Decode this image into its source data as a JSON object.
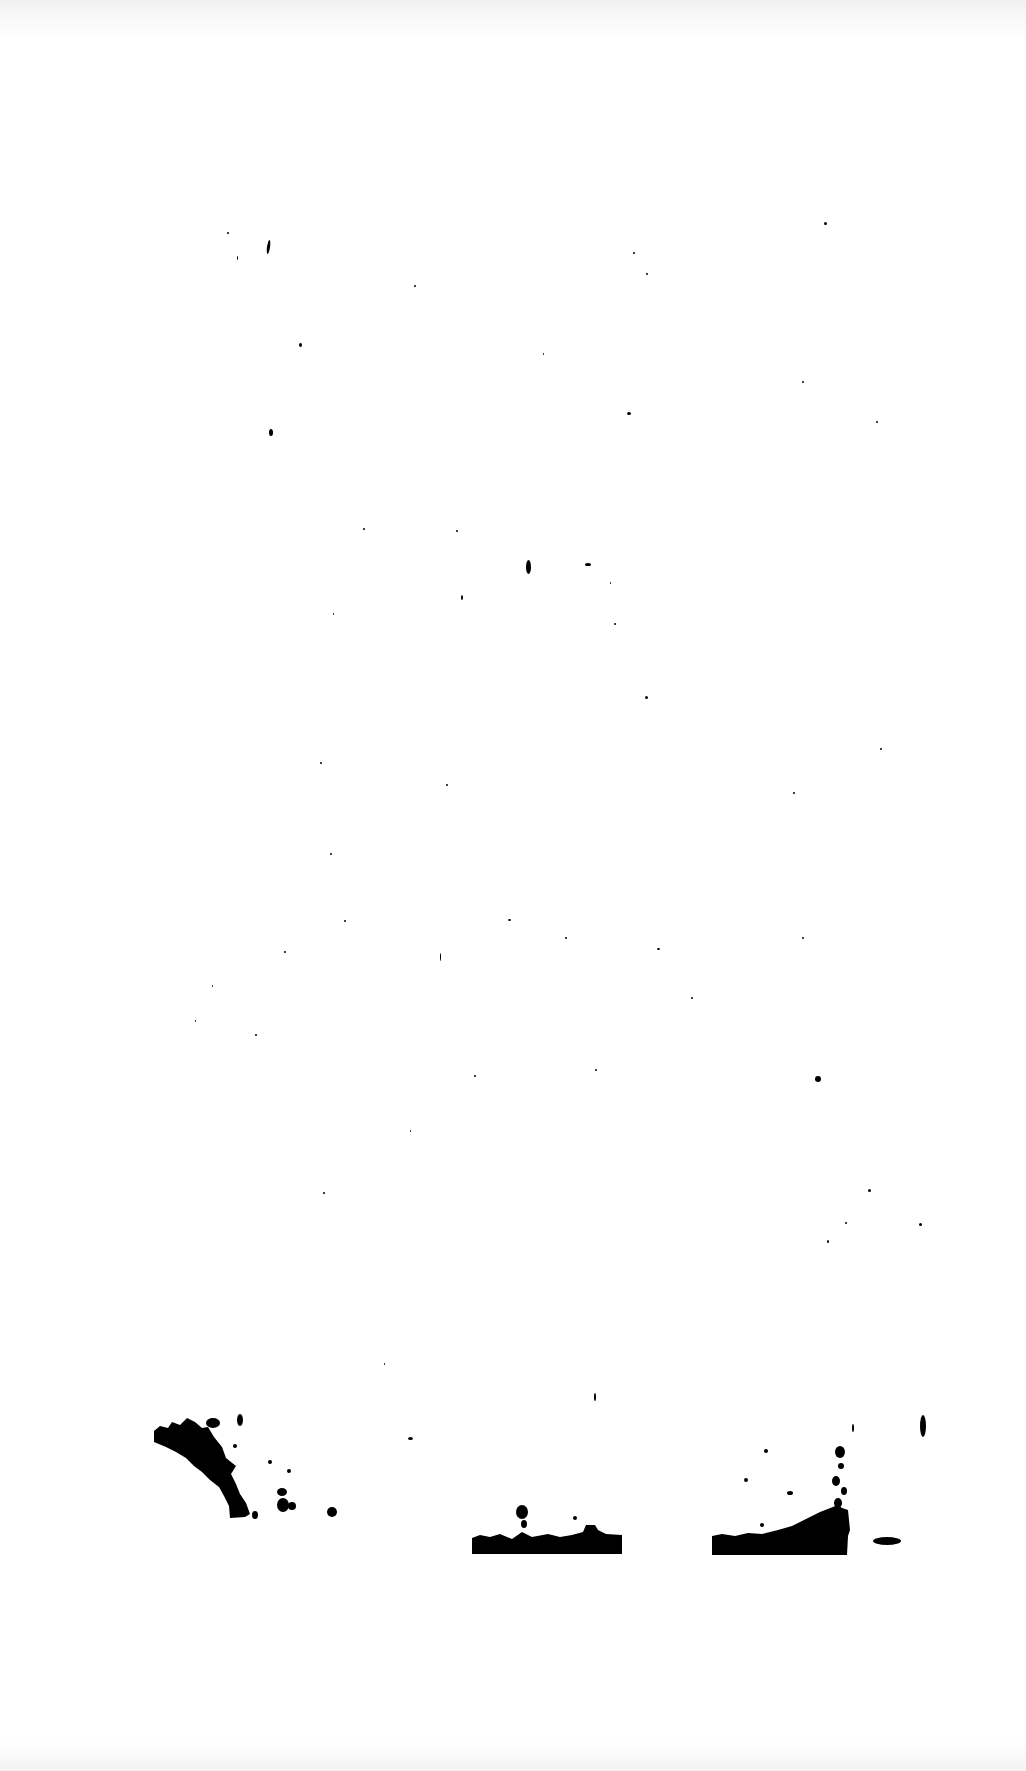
{
  "page": {
    "background": "#ffffff",
    "ink_color": "#000000",
    "text_content": ""
  },
  "specks": [
    {
      "x": 227,
      "y": 232,
      "w": 2,
      "h": 2
    },
    {
      "x": 267,
      "y": 240,
      "w": 3,
      "h": 14,
      "r": 8
    },
    {
      "x": 237,
      "y": 256,
      "w": 1,
      "h": 4
    },
    {
      "x": 414,
      "y": 285,
      "w": 2,
      "h": 2
    },
    {
      "x": 633,
      "y": 252,
      "w": 2,
      "h": 2
    },
    {
      "x": 646,
      "y": 273,
      "w": 2,
      "h": 2
    },
    {
      "x": 824,
      "y": 222,
      "w": 3,
      "h": 3
    },
    {
      "x": 299,
      "y": 343,
      "w": 3,
      "h": 4
    },
    {
      "x": 543,
      "y": 353,
      "w": 1,
      "h": 2
    },
    {
      "x": 802,
      "y": 381,
      "w": 2,
      "h": 2
    },
    {
      "x": 627,
      "y": 412,
      "w": 4,
      "h": 3
    },
    {
      "x": 876,
      "y": 421,
      "w": 2,
      "h": 2
    },
    {
      "x": 269,
      "y": 429,
      "w": 4,
      "h": 7
    },
    {
      "x": 363,
      "y": 528,
      "w": 2,
      "h": 2
    },
    {
      "x": 526,
      "y": 560,
      "w": 5,
      "h": 14
    },
    {
      "x": 585,
      "y": 563,
      "w": 6,
      "h": 3
    },
    {
      "x": 610,
      "y": 582,
      "w": 1,
      "h": 2
    },
    {
      "x": 456,
      "y": 530,
      "w": 2,
      "h": 2
    },
    {
      "x": 461,
      "y": 595,
      "w": 2,
      "h": 5
    },
    {
      "x": 333,
      "y": 613,
      "w": 1,
      "h": 2
    },
    {
      "x": 614,
      "y": 623,
      "w": 2,
      "h": 2
    },
    {
      "x": 645,
      "y": 696,
      "w": 3,
      "h": 3
    },
    {
      "x": 320,
      "y": 762,
      "w": 2,
      "h": 2
    },
    {
      "x": 446,
      "y": 784,
      "w": 2,
      "h": 2
    },
    {
      "x": 880,
      "y": 748,
      "w": 2,
      "h": 2
    },
    {
      "x": 793,
      "y": 792,
      "w": 2,
      "h": 2
    },
    {
      "x": 330,
      "y": 853,
      "w": 2,
      "h": 2
    },
    {
      "x": 344,
      "y": 920,
      "w": 2,
      "h": 2
    },
    {
      "x": 508,
      "y": 919,
      "w": 3,
      "h": 2
    },
    {
      "x": 565,
      "y": 937,
      "w": 2,
      "h": 2
    },
    {
      "x": 657,
      "y": 948,
      "w": 3,
      "h": 2
    },
    {
      "x": 802,
      "y": 937,
      "w": 2,
      "h": 2
    },
    {
      "x": 440,
      "y": 953,
      "w": 1,
      "h": 8
    },
    {
      "x": 284,
      "y": 951,
      "w": 2,
      "h": 2
    },
    {
      "x": 212,
      "y": 985,
      "w": 1,
      "h": 2
    },
    {
      "x": 195,
      "y": 1020,
      "w": 1,
      "h": 2
    },
    {
      "x": 255,
      "y": 1034,
      "w": 2,
      "h": 2
    },
    {
      "x": 691,
      "y": 997,
      "w": 2,
      "h": 2
    },
    {
      "x": 815,
      "y": 1076,
      "w": 6,
      "h": 6
    },
    {
      "x": 474,
      "y": 1075,
      "w": 2,
      "h": 2
    },
    {
      "x": 595,
      "y": 1069,
      "w": 2,
      "h": 2
    },
    {
      "x": 410,
      "y": 1130,
      "w": 1,
      "h": 2
    },
    {
      "x": 323,
      "y": 1192,
      "w": 2,
      "h": 2
    },
    {
      "x": 868,
      "y": 1189,
      "w": 3,
      "h": 3
    },
    {
      "x": 845,
      "y": 1222,
      "w": 2,
      "h": 2
    },
    {
      "x": 919,
      "y": 1223,
      "w": 3,
      "h": 3
    },
    {
      "x": 827,
      "y": 1240,
      "w": 2,
      "h": 3
    },
    {
      "x": 384,
      "y": 1363,
      "w": 1,
      "h": 2
    },
    {
      "x": 594,
      "y": 1393,
      "w": 2,
      "h": 8
    },
    {
      "x": 408,
      "y": 1437,
      "w": 5,
      "h": 3
    },
    {
      "x": 920,
      "y": 1415,
      "w": 6,
      "h": 22
    }
  ],
  "blots": [
    {
      "name": "ink-blot-left",
      "points": "154,1431 160,1426 168,1428 172,1422 180,1425 187,1418 195,1422 202,1428 208,1427 214,1437 222,1447 226,1458 236,1466 231,1474 236,1484 240,1494 246,1503 250,1514 245,1517 230,1518 229,1506 224,1496 219,1487 210,1480 202,1472 194,1466 186,1458 176,1452 166,1447 154,1442",
      "extras": [
        {
          "cx": 213,
          "cy": 1423,
          "rx": 7,
          "ry": 5
        },
        {
          "cx": 240,
          "cy": 1420,
          "rx": 3,
          "ry": 6
        },
        {
          "cx": 282,
          "cy": 1492,
          "rx": 5,
          "ry": 4
        },
        {
          "cx": 283,
          "cy": 1505,
          "rx": 6,
          "ry": 7
        },
        {
          "cx": 292,
          "cy": 1506,
          "rx": 4,
          "ry": 4
        },
        {
          "cx": 332,
          "cy": 1512,
          "rx": 5,
          "ry": 5
        },
        {
          "cx": 255,
          "cy": 1515,
          "rx": 3,
          "ry": 4
        },
        {
          "cx": 235,
          "cy": 1446,
          "rx": 2,
          "ry": 2
        },
        {
          "cx": 289,
          "cy": 1471,
          "rx": 2,
          "ry": 2
        },
        {
          "cx": 270,
          "cy": 1462,
          "rx": 2,
          "ry": 2
        }
      ]
    },
    {
      "name": "ink-blot-middle",
      "points": "472,1538 480,1535 490,1537 500,1534 512,1539 522,1532 532,1537 548,1534 560,1537 572,1535 583,1532 586,1525 595,1525 598,1530 606,1534 622,1535 622,1554 472,1554",
      "extras": [
        {
          "cx": 522,
          "cy": 1512,
          "rx": 6,
          "ry": 7
        },
        {
          "cx": 524,
          "cy": 1524,
          "rx": 3,
          "ry": 4
        },
        {
          "cx": 575,
          "cy": 1518,
          "rx": 2,
          "ry": 2
        }
      ]
    },
    {
      "name": "ink-blot-right",
      "points": "712,1536 722,1534 735,1536 748,1533 762,1534 778,1530 792,1526 804,1520 812,1516 820,1512 838,1505 842,1508 848,1510 850,1530 848,1536 847,1555 712,1555",
      "extras": [
        {
          "cx": 840,
          "cy": 1452,
          "rx": 5,
          "ry": 6
        },
        {
          "cx": 841,
          "cy": 1466,
          "rx": 3,
          "ry": 3
        },
        {
          "cx": 836,
          "cy": 1481,
          "rx": 4,
          "ry": 5
        },
        {
          "cx": 844,
          "cy": 1491,
          "rx": 3,
          "ry": 4
        },
        {
          "cx": 838,
          "cy": 1503,
          "rx": 4,
          "ry": 5
        },
        {
          "cx": 836,
          "cy": 1523,
          "rx": 4,
          "ry": 10
        },
        {
          "cx": 790,
          "cy": 1493,
          "rx": 3,
          "ry": 2
        },
        {
          "cx": 887,
          "cy": 1541,
          "rx": 14,
          "ry": 4
        },
        {
          "cx": 762,
          "cy": 1525,
          "rx": 2,
          "ry": 2
        },
        {
          "cx": 766,
          "cy": 1451,
          "rx": 2,
          "ry": 2
        },
        {
          "cx": 746,
          "cy": 1480,
          "rx": 2,
          "ry": 2
        },
        {
          "cx": 853,
          "cy": 1428,
          "rx": 1,
          "ry": 4
        }
      ]
    }
  ]
}
